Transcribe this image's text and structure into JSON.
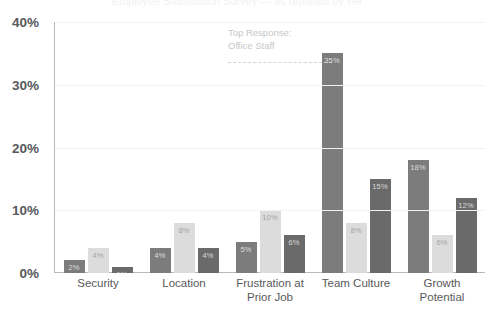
{
  "header": {
    "cropped_title": "Employee Satisfaction Survey — as reported by HR"
  },
  "annotation": {
    "line1": "Top Response:",
    "line2": "Office Staff"
  },
  "axis": {
    "y_ticks": [
      "40%",
      "30%",
      "20%",
      "10%",
      "0%"
    ]
  },
  "chart_data": {
    "type": "bar",
    "title": "",
    "xlabel": "",
    "ylabel": "",
    "ylim": [
      0,
      40
    ],
    "grid": true,
    "legend": "none",
    "categories": [
      "Security",
      "Location",
      "Frustration at Prior Job",
      "Team Culture",
      "Growth Potential"
    ],
    "category_lines": [
      [
        "Security"
      ],
      [
        "Location"
      ],
      [
        "Frustration at",
        "Prior Job"
      ],
      [
        "Team Culture"
      ],
      [
        "Growth",
        "Potential"
      ]
    ],
    "series": [
      {
        "name": "Series 1",
        "color": "#7c7c7c",
        "values": [
          2,
          4,
          5,
          35,
          18
        ],
        "labels": [
          "2%",
          "4%",
          "5%",
          "35%",
          "18%"
        ]
      },
      {
        "name": "Series 2",
        "color": "#dcdcdc",
        "values": [
          4,
          8,
          10,
          8,
          6
        ],
        "labels": [
          "4%",
          "8%",
          "10%",
          "8%",
          "6%"
        ]
      },
      {
        "name": "Series 3",
        "color": "#6a6a6a",
        "values": [
          1,
          4,
          6,
          15,
          12
        ],
        "labels": [
          "1%",
          "4%",
          "6%",
          "15%",
          "12%"
        ]
      }
    ]
  }
}
